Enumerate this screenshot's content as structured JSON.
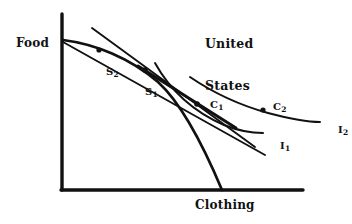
{
  "figure": {
    "kind": "economics-diagram",
    "background_color": "#ffffff",
    "ink_color": "#111111",
    "title": {
      "line1": "United",
      "line2": "States",
      "x": 205,
      "y": 9
    },
    "axes": {
      "y_label": "Food",
      "x_label": "Clothing",
      "origin": {
        "x": 62,
        "y": 190
      },
      "y_top": {
        "x": 62,
        "y": 14
      },
      "x_right": {
        "x": 303,
        "y": 190
      },
      "stroke_width": 3.2,
      "y_label_pos": {
        "x": 16,
        "y": 37
      },
      "x_label_pos": {
        "x": 195,
        "y": 199
      }
    },
    "points": [
      {
        "id": "S2",
        "label": "S",
        "sub": "2",
        "dot": {
          "x": 99,
          "y": 50
        },
        "label_pos": {
          "x": 92,
          "y": 55
        }
      },
      {
        "id": "S1",
        "label": "S",
        "sub": "1",
        "dot": {
          "x": 145,
          "y": 70
        },
        "label_pos": {
          "x": 131,
          "y": 75
        }
      },
      {
        "id": "C1",
        "label": "C",
        "sub": "1",
        "dot": {
          "x": 197,
          "y": 104
        },
        "label_pos": {
          "x": 196,
          "y": 88
        }
      },
      {
        "id": "C2",
        "label": "C",
        "sub": "2",
        "dot": {
          "x": 263,
          "y": 110
        },
        "label_pos": {
          "x": 259,
          "y": 90
        }
      }
    ],
    "curve_labels": [
      {
        "id": "I1",
        "label": "I",
        "sub": "1",
        "label_pos": {
          "x": 266,
          "y": 129
        }
      },
      {
        "id": "I2",
        "label": "I",
        "sub": "2",
        "label_pos": {
          "x": 324,
          "y": 113
        }
      }
    ],
    "curves": {
      "ppf": {
        "name": "production-possibility-frontier",
        "path": "M 63 40 C 95 44 130 58 158 82 C 180 102 200 140 222 190",
        "stroke_width": 2.6
      },
      "indifference_1": {
        "name": "indifference-curve-i1",
        "path": "M 155 63 C 172 92 196 113 225 126 C 240 131 252 133 263 133",
        "stroke_width": 2.0
      },
      "indifference_2": {
        "name": "indifference-curve-i2",
        "path": "M 190 77 C 212 92 238 105 268 113 C 290 119 306 122 320 122",
        "stroke_width": 2.0
      },
      "price_line_1": {
        "name": "price-line-autarky",
        "path": "M 63 42 L 265 155",
        "stroke_width": 2.0
      },
      "price_line_2": {
        "name": "price-line-trade",
        "path": "M 92 28 L 255 147",
        "stroke_width": 2.0
      },
      "thick_trade_line": {
        "name": "thick-trade-price-line",
        "path": "M 140 68 L 233 126",
        "stroke_width": 3.0
      }
    }
  }
}
